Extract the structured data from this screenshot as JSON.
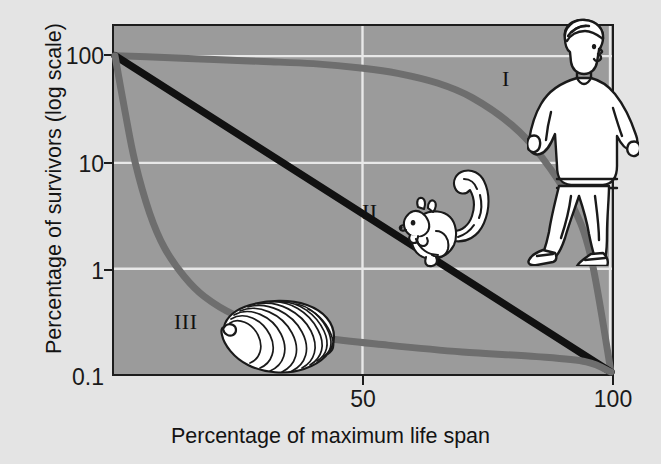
{
  "figure": {
    "background_color": "#e4e4e4",
    "plot_background_color": "#9b9b9b",
    "gridline_color": "#e8e8e8",
    "frame_color": "#1c1c1c"
  },
  "axes": {
    "y_title": "Percentage of survivors (log scale)",
    "x_title": "Percentage of maximum life span",
    "y_ticks": [
      "100",
      "10",
      "1",
      "0.1"
    ],
    "x_ticks": [
      "50",
      "100"
    ]
  },
  "curve_labels": [
    {
      "id": "I",
      "text": "I"
    },
    {
      "id": "II",
      "text": "II"
    },
    {
      "id": "III",
      "text": "III"
    }
  ],
  "organisms": [
    {
      "id": "human",
      "name": "jogging-human",
      "curve": "I"
    },
    {
      "id": "squirrel",
      "name": "squirrel",
      "curve": "II"
    },
    {
      "id": "oyster",
      "name": "oyster-shell",
      "curve": "III"
    }
  ],
  "chart_data": {
    "type": "line",
    "title": "",
    "xlabel": "Percentage of maximum life span",
    "ylabel": "Percentage of survivors (log scale)",
    "xlim": [
      0,
      105
    ],
    "ylim": [
      0.1,
      100
    ],
    "yscale": "log",
    "grid": true,
    "legend": "inline-roman-numerals",
    "x_ticks": [
      50,
      100
    ],
    "y_ticks": [
      0.1,
      1,
      10,
      100
    ],
    "series": [
      {
        "name": "I",
        "label": "Type I (human)",
        "color": "#6e6e6e",
        "description": "Low mortality early in life, most deaths late in life",
        "x": [
          0,
          10,
          20,
          30,
          40,
          50,
          57,
          65,
          72,
          80,
          86,
          92,
          96,
          100
        ],
        "y": [
          100,
          96,
          92,
          88,
          84,
          76,
          68,
          55,
          40,
          22,
          11,
          4,
          1.2,
          0.1
        ]
      },
      {
        "name": "II",
        "label": "Type II (squirrel)",
        "color": "#111111",
        "description": "Constant mortality rate throughout life",
        "x": [
          0,
          10,
          20,
          30,
          40,
          50,
          60,
          70,
          80,
          90,
          100
        ],
        "y": [
          100,
          50,
          25,
          12.6,
          6.3,
          3.16,
          1.58,
          0.79,
          0.4,
          0.2,
          0.1
        ]
      },
      {
        "name": "III",
        "label": "Type III (oyster)",
        "color": "#6e6e6e",
        "description": "Very high mortality early in life, survivors live long",
        "x": [
          0,
          2,
          4,
          7,
          10,
          14,
          18,
          24,
          32,
          42,
          55,
          70,
          85,
          95,
          100
        ],
        "y": [
          100,
          30,
          10,
          3.2,
          1.5,
          0.8,
          0.52,
          0.35,
          0.26,
          0.21,
          0.18,
          0.155,
          0.14,
          0.125,
          0.1
        ]
      }
    ]
  }
}
